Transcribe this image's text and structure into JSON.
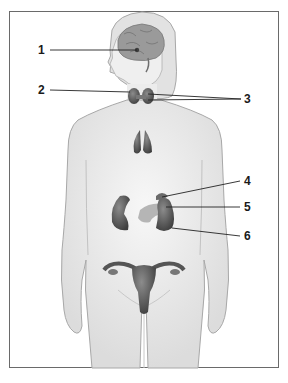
{
  "diagram": {
    "type": "anatomy-figure",
    "labels": [
      {
        "id": "1",
        "text": "1",
        "points_to": "brain-center-gland"
      },
      {
        "id": "2",
        "text": "2",
        "points_to": "neck-gland-left"
      },
      {
        "id": "3",
        "text": "3",
        "points_to": "neck-gland-right (two leader lines)"
      },
      {
        "id": "4",
        "text": "4",
        "points_to": "gland-above-left-kidney"
      },
      {
        "id": "5",
        "text": "5",
        "points_to": "abdominal-gland"
      },
      {
        "id": "6",
        "text": "6",
        "points_to": "left-kidney"
      }
    ],
    "colors": {
      "frame": "#6a6a6a",
      "body_fill": "#f0f0f0",
      "body_outline": "#a8a8a8",
      "organ_dark": "#5a5a5a",
      "organ_mid": "#8a8a8a",
      "organ_light": "#b5b5b5",
      "leader_line": "#222222"
    }
  }
}
